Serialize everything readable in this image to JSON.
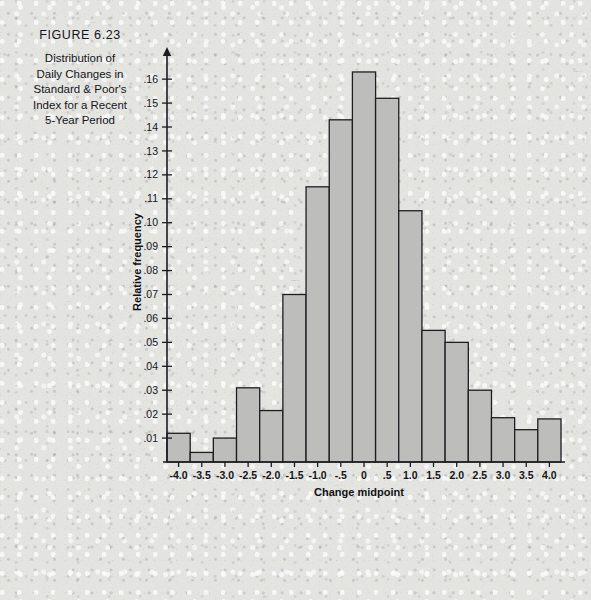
{
  "figure": {
    "number_label": "FIGURE 6.23",
    "title_lines": [
      "Distribution of",
      "Daily Changes in",
      "Standard & Poor's",
      "Index for a Recent",
      "5-Year Period"
    ]
  },
  "colors": {
    "bar_fill": "#bdbdbb",
    "bar_stroke": "#1d1e22",
    "axis": "#1b1c20",
    "text": "#141519",
    "paper": "#e6e6e3"
  },
  "chart_data": {
    "type": "bar",
    "title": "Distribution of Daily Changes in Standard & Poor's Index for a Recent 5-Year Period",
    "xlabel": "Change midpoint",
    "ylabel": "Relative frequency",
    "grid": false,
    "legend": null,
    "xlim": [
      -4.25,
      4.25
    ],
    "ylim": [
      0,
      0.168
    ],
    "xtick_labels": [
      "-4.0",
      "-3.5",
      "-3.0",
      "-2.5",
      "-2.0",
      "-1.5",
      "-1.0",
      "-.5",
      "0",
      ".5",
      "1.0",
      "1.5",
      "2.0",
      "2.5",
      "3.0",
      "3.5",
      "4.0"
    ],
    "xticks": [
      -4.0,
      -3.5,
      -3.0,
      -2.5,
      -2.0,
      -1.5,
      -1.0,
      -0.5,
      0,
      0.5,
      1.0,
      1.5,
      2.0,
      2.5,
      3.0,
      3.5,
      4.0
    ],
    "ytick_labels": [
      ".01",
      ".02",
      ".03",
      ".04",
      ".05",
      ".06",
      ".07",
      ".08",
      ".09",
      ".10",
      ".11",
      ".12",
      ".13",
      ".14",
      ".15",
      ".16"
    ],
    "yticks": [
      0.01,
      0.02,
      0.03,
      0.04,
      0.05,
      0.06,
      0.07,
      0.08,
      0.09,
      0.1,
      0.11,
      0.12,
      0.13,
      0.14,
      0.15,
      0.16
    ],
    "bar_width": 0.5,
    "categories": [
      "-4.0",
      "-3.5",
      "-3.0",
      "-2.5",
      "-2.0",
      "-1.5",
      "-1.0",
      "-.5",
      "0",
      ".5",
      "1.0",
      "1.5",
      "2.0",
      "2.5",
      "3.0",
      "3.5",
      "4.0"
    ],
    "values": [
      0.012,
      0.004,
      0.01,
      0.031,
      0.0215,
      0.07,
      0.115,
      0.143,
      0.163,
      0.152,
      0.105,
      0.055,
      0.05,
      0.03,
      0.0185,
      0.0135,
      0.018
    ]
  }
}
